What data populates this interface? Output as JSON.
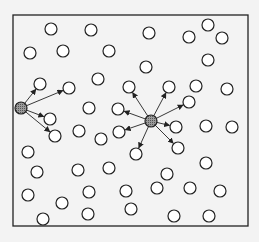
{
  "diagram": {
    "type": "node-broadcast-network",
    "frame": {
      "x": 13,
      "y": 15,
      "width": 235,
      "height": 211
    },
    "colors": {
      "background": "#f3f3f3",
      "stroke": "#222222",
      "node_fill": "#ffffff",
      "hub_fill": "#8a8a8a"
    },
    "node_radius": 6,
    "hubs": [
      {
        "id": "hub-left",
        "x": 21,
        "y": 108,
        "targets": [
          [
            40,
            84
          ],
          [
            69,
            88
          ],
          [
            50,
            119
          ],
          [
            55,
            136
          ]
        ]
      },
      {
        "id": "hub-center",
        "x": 151,
        "y": 121,
        "targets": [
          [
            129,
            87
          ],
          [
            169,
            87
          ],
          [
            189,
            102
          ],
          [
            118,
            109
          ],
          [
            119,
            132
          ],
          [
            176,
            127
          ],
          [
            136,
            154
          ],
          [
            178,
            148
          ]
        ]
      }
    ],
    "nodes": [
      [
        51,
        29
      ],
      [
        91,
        30
      ],
      [
        149,
        33
      ],
      [
        189,
        37
      ],
      [
        208,
        25
      ],
      [
        222,
        38
      ],
      [
        30,
        53
      ],
      [
        63,
        51
      ],
      [
        109,
        51
      ],
      [
        208,
        60
      ],
      [
        146,
        67
      ],
      [
        98,
        79
      ],
      [
        40,
        84
      ],
      [
        69,
        88
      ],
      [
        129,
        87
      ],
      [
        169,
        87
      ],
      [
        196,
        86
      ],
      [
        227,
        89
      ],
      [
        89,
        108
      ],
      [
        118,
        109
      ],
      [
        189,
        102
      ],
      [
        50,
        119
      ],
      [
        55,
        136
      ],
      [
        79,
        131
      ],
      [
        101,
        139
      ],
      [
        119,
        132
      ],
      [
        176,
        127
      ],
      [
        206,
        126
      ],
      [
        232,
        127
      ],
      [
        136,
        154
      ],
      [
        178,
        148
      ],
      [
        28,
        152
      ],
      [
        37,
        172
      ],
      [
        78,
        170
      ],
      [
        109,
        168
      ],
      [
        206,
        163
      ],
      [
        167,
        174
      ],
      [
        157,
        188
      ],
      [
        190,
        188
      ],
      [
        126,
        191
      ],
      [
        89,
        192
      ],
      [
        220,
        191
      ],
      [
        28,
        195
      ],
      [
        62,
        203
      ],
      [
        88,
        214
      ],
      [
        43,
        219
      ],
      [
        131,
        209
      ],
      [
        174,
        216
      ],
      [
        209,
        216
      ]
    ]
  }
}
